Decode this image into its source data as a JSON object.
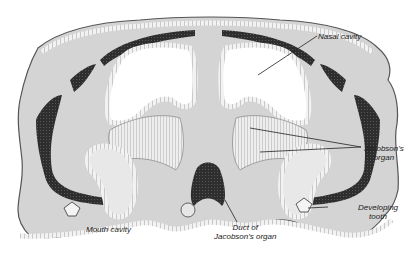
{
  "figure": {
    "colors": {
      "tissue_fill": "#d4d4d4",
      "epithelium": "#9a9a9a",
      "cartilage_dark": "#3a3a3a",
      "cavity": "#ffffff",
      "outline": "#444444"
    }
  },
  "labels": {
    "nasal_cavity": "Nasal cavity",
    "jacobsons_organ_line1": "Jacobson's",
    "jacobsons_organ_line2": "organ",
    "developing_tooth_line1": "Developing",
    "developing_tooth_line2": "tooth",
    "mouth_cavity": "Mouth cavity",
    "duct_line1": "Duct of",
    "duct_line2": "Jacobson's organ"
  }
}
